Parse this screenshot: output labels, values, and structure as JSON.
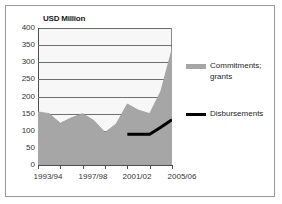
{
  "chart_data": {
    "type": "area",
    "title": "USD Million",
    "xlabel": "",
    "ylabel": "",
    "ylim": [
      0,
      400
    ],
    "ytick_labels": [
      "400",
      "350",
      "300",
      "250",
      "200",
      "150",
      "100",
      "50",
      "0"
    ],
    "ytick_values": [
      400,
      350,
      300,
      250,
      200,
      150,
      100,
      50,
      0
    ],
    "grid": true,
    "legend_position": "right",
    "x": [
      "1993/94",
      "1994/95",
      "1995/96",
      "1996/97",
      "1997/98",
      "1998/99",
      "1999/00",
      "2000/01",
      "2001/02",
      "2002/03",
      "2003/04",
      "2004/05",
      "2005/06"
    ],
    "xtick_labels": [
      "1993/94",
      "1997/98",
      "2001/02",
      "2005/06"
    ],
    "xtick_indices": [
      0,
      4,
      8,
      12
    ],
    "series": [
      {
        "name": "Commitments; grants",
        "type": "area",
        "color": "#a6a6a6",
        "values": [
          155,
          150,
          122,
          138,
          150,
          130,
          95,
          120,
          178,
          160,
          150,
          215,
          338
        ]
      },
      {
        "name": "Disbursements",
        "type": "line",
        "color": "#000000",
        "start_index": 8,
        "values": [
          null,
          null,
          null,
          null,
          null,
          null,
          null,
          null,
          90,
          90,
          90,
          110,
          132
        ]
      }
    ]
  },
  "legend": {
    "commitments_label": "Commitments;\ngrants",
    "disbursements_label": "Disbursements"
  },
  "colors": {
    "area_fill": "#a6a6a6",
    "line": "#000000",
    "plot_background": "#f7f7f7",
    "gridline": "#6e6e6e",
    "axis": "#4d4d4d",
    "frame": "#999999",
    "text": "#333333"
  }
}
